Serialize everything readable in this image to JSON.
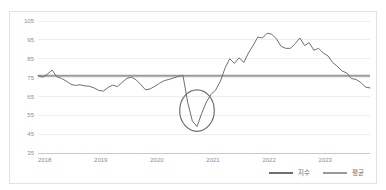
{
  "chart_data": {
    "type": "line",
    "title": "",
    "subtitle": "",
    "xlabel": "",
    "ylabel": "",
    "ylim": [
      35,
      105
    ],
    "yticks": [
      105,
      95,
      85,
      75,
      65,
      55,
      45,
      35
    ],
    "xticks": [
      "2018",
      "2019",
      "2020",
      "2021",
      "2022",
      "2023"
    ],
    "grid": true,
    "legend_position": "bottom-right",
    "legend": [
      "지수",
      "평균"
    ],
    "colors": {
      "series": "#6f6f6f",
      "average": "#9a9a9a",
      "annotation": "#707070",
      "grid": "#eeeeee",
      "axis": "#c9c9c9",
      "tick_text": "#8d8d8d",
      "border": "#e2e2e2"
    },
    "x_start": "2018-01",
    "x_end": "2023-12",
    "x_count": 72,
    "series": [
      {
        "name": "지수",
        "type": "line",
        "values": [
          76.0,
          75.2,
          76.8,
          79.0,
          75.5,
          74.6,
          73.2,
          71.5,
          70.8,
          71.2,
          70.6,
          70.4,
          69.5,
          68.2,
          67.8,
          69.8,
          71.0,
          70.2,
          72.4,
          74.6,
          75.2,
          73.8,
          71.2,
          68.5,
          69.0,
          70.4,
          72.0,
          73.4,
          74.0,
          74.8,
          75.6,
          76.2,
          62.0,
          52.0,
          49.0,
          56.0,
          62.0,
          66.0,
          68.5,
          73.0,
          80.0,
          85.0,
          82.5,
          85.5,
          83.0,
          88.0,
          92.0,
          96.5,
          96.0,
          98.5,
          98.0,
          95.5,
          91.5,
          90.5,
          90.5,
          93.0,
          96.0,
          92.0,
          93.5,
          89.5,
          90.5,
          88.0,
          86.5,
          83.0,
          81.0,
          78.5,
          77.5,
          74.5,
          74.0,
          72.5,
          70.0,
          69.5
        ]
      },
      {
        "name": "평균",
        "type": "reference-line",
        "value": 76.0
      }
    ],
    "annotations": [
      {
        "type": "ellipse",
        "label": "covid-dip-highlight",
        "center_x_index": 34,
        "center_y_value": 57.5,
        "radius_x_index": 3.7,
        "radius_y_value": 11.0
      }
    ]
  }
}
